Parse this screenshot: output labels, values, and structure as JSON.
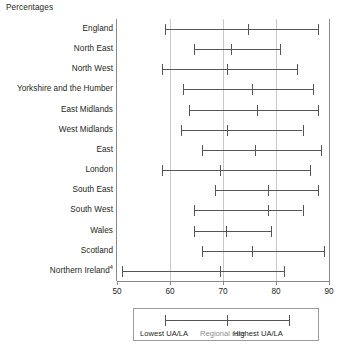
{
  "units_label": "Percentages",
  "legend": {
    "lowest_label": "Lowest UA/LA",
    "regional_label": "Regional rate",
    "highest_label": "Highest UA/LA",
    "regional_color": "#8c8c8c",
    "line_color": "#555555"
  },
  "axis": {
    "ticks": [
      "50",
      "60",
      "70",
      "80",
      "90"
    ],
    "min": 50,
    "max": 90
  },
  "chart_data": {
    "type": "range",
    "title": "",
    "subtitle": "",
    "xlabel": "Percentages",
    "ylabel": "",
    "xlim": [
      50,
      90
    ],
    "grid": "vertical gridlines at 60, 70, 80",
    "legend_position": "below plot, boxed",
    "tick_values": [
      50,
      60,
      70,
      80,
      90
    ],
    "categories": [
      "England",
      "North East",
      "North West",
      "Yorkshire and the Humber",
      "East Midlands",
      "West Midlands",
      "East",
      "London",
      "South East",
      "South West",
      "Wales",
      "Scotland",
      "Northern Ireland"
    ],
    "series": [
      {
        "name": "Lowest UA/LA",
        "values": [
          59.0,
          64.5,
          58.5,
          62.5,
          63.5,
          62.0,
          66.0,
          58.5,
          68.5,
          64.5,
          64.5,
          66.0,
          51.0
        ]
      },
      {
        "name": "Regional rate",
        "values": [
          74.7,
          71.5,
          70.8,
          75.5,
          76.5,
          70.8,
          76.0,
          69.5,
          78.5,
          78.5,
          70.5,
          75.5,
          69.5
        ]
      },
      {
        "name": "Highest UA/LA",
        "values": [
          88.0,
          80.8,
          84.0,
          87.0,
          88.0,
          85.0,
          88.5,
          86.5,
          88.0,
          85.0,
          79.0,
          89.0,
          81.5
        ]
      }
    ]
  },
  "rows": [
    {
      "label": "England",
      "sup": "",
      "low": 59.0,
      "mid": 74.7,
      "high": 88.0
    },
    {
      "label": "North East",
      "sup": "",
      "low": 64.5,
      "mid": 71.5,
      "high": 80.8
    },
    {
      "label": "North West",
      "sup": "",
      "low": 58.5,
      "mid": 70.8,
      "high": 84.0
    },
    {
      "label": "Yorkshire and the Humber",
      "sup": "",
      "low": 62.5,
      "mid": 75.5,
      "high": 87.0
    },
    {
      "label": "East Midlands",
      "sup": "",
      "low": 63.5,
      "mid": 76.5,
      "high": 88.0
    },
    {
      "label": "West Midlands",
      "sup": "",
      "low": 62.0,
      "mid": 70.8,
      "high": 85.0
    },
    {
      "label": "East",
      "sup": "",
      "low": 66.0,
      "mid": 76.0,
      "high": 88.5
    },
    {
      "label": "London",
      "sup": "",
      "low": 58.5,
      "mid": 69.5,
      "high": 86.5
    },
    {
      "label": "South East",
      "sup": "",
      "low": 68.5,
      "mid": 78.5,
      "high": 88.0
    },
    {
      "label": "South West",
      "sup": "",
      "low": 64.5,
      "mid": 78.5,
      "high": 85.0
    },
    {
      "label": "Wales",
      "sup": "",
      "low": 64.5,
      "mid": 70.5,
      "high": 79.0
    },
    {
      "label": "Scotland",
      "sup": "",
      "low": 66.0,
      "mid": 75.5,
      "high": 89.0
    },
    {
      "label": "Northern Ireland",
      "sup": "4",
      "low": 51.0,
      "mid": 69.5,
      "high": 81.5
    }
  ]
}
